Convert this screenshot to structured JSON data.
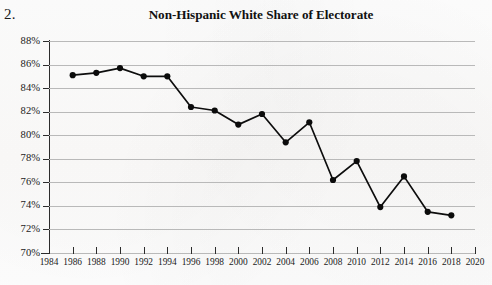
{
  "item_number": "2.",
  "chart_data": {
    "type": "line",
    "title": "Non-Hispanic White Share of Electorate",
    "xlabel": "",
    "ylabel": "",
    "grid": true,
    "legend": false,
    "xlim": [
      1984,
      2020
    ],
    "ylim": [
      70,
      88
    ],
    "xticks": [
      1984,
      1986,
      1988,
      1990,
      1992,
      1994,
      1996,
      1998,
      2000,
      2002,
      2004,
      2006,
      2008,
      2010,
      2012,
      2014,
      2016,
      2018,
      2020
    ],
    "xticklabels": [
      "1984",
      "1986",
      "1988",
      "1990",
      "1992",
      "1994",
      "1996",
      "1998",
      "2000",
      "2002",
      "2004",
      "2006",
      "2008",
      "2010",
      "2012",
      "2014",
      "2016",
      "2018",
      "2020"
    ],
    "yticks": [
      70,
      72,
      74,
      76,
      78,
      80,
      82,
      84,
      86,
      88
    ],
    "yticklabels": [
      "70%",
      "72%",
      "74%",
      "76%",
      "78%",
      "80%",
      "82%",
      "84%",
      "86%",
      "88%"
    ],
    "x": [
      1986,
      1988,
      1990,
      1992,
      1994,
      1996,
      1998,
      2000,
      2002,
      2004,
      2006,
      2008,
      2010,
      2012,
      2014,
      2016,
      2018
    ],
    "values": [
      85.1,
      85.3,
      85.7,
      85.0,
      85.0,
      82.4,
      82.1,
      80.9,
      81.8,
      79.4,
      81.1,
      76.2,
      77.8,
      73.9,
      76.5,
      73.5,
      73.2
    ],
    "series": [
      {
        "name": "Non-Hispanic White Share of Electorate",
        "color": "#0b0b0b",
        "marker": "circle",
        "values": [
          85.1,
          85.3,
          85.7,
          85.0,
          85.0,
          82.4,
          82.1,
          80.9,
          81.8,
          79.4,
          81.1,
          76.2,
          77.8,
          73.9,
          76.5,
          73.5,
          73.2
        ]
      }
    ]
  }
}
